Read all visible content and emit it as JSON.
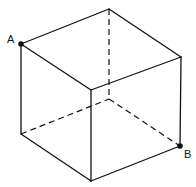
{
  "diagram": {
    "type": "cube-wireframe",
    "labels": {
      "A": "A",
      "B": "B"
    },
    "colors": {
      "stroke": "#111111",
      "background": "#ffffff"
    }
  }
}
